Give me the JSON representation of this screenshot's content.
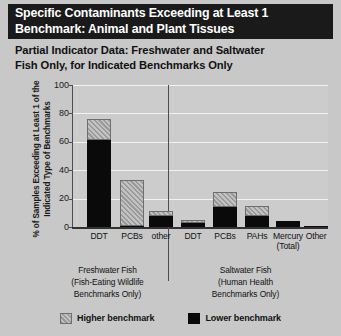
{
  "header": {
    "title_line1": "Specific Contaminants Exceeding at Least 1",
    "title_line2": "Benchmark: Animal and Plant Tissues",
    "subtitle_line1": "Partial Indicator Data: Freshwater and Saltwater",
    "subtitle_line2": "Fish Only, for Indicated Benchmarks Only"
  },
  "groups": {
    "freshwater": {
      "line1": "Freshwater Fish",
      "line2": "(Fish-Eating Wildlife",
      "line3": "Benchmarks Only)"
    },
    "saltwater": {
      "line1": "Saltwater Fish",
      "line2": "(Human Health",
      "line3": "Benchmarks Only)"
    }
  },
  "legend": {
    "higher_label": "Higher benchmark",
    "lower_label": "Lower benchmark",
    "higher_color": "#9a9a9a",
    "lower_color": "#0a0a0a"
  },
  "colors": {
    "page_background": "#c8c8c8",
    "header_background": "#1a1a1a",
    "header_text": "#ffffff",
    "plot_background": "#cccccc",
    "gridline": "#f2f2f2",
    "axis": "#4d4d4d",
    "text": "#111111"
  },
  "chart_data": {
    "type": "bar",
    "title": "Specific Contaminants Exceeding at Least 1 Benchmark: Animal and Plant Tissues",
    "subtitle": "Partial Indicator Data: Freshwater and Saltwater Fish Only, for Indicated Benchmarks Only",
    "xlabel": "",
    "ylabel": "% of Samples Exceeding at Least 1 of the Indicated Type of Benchmarks",
    "ylim": [
      0,
      100
    ],
    "yticks": [
      0,
      20,
      40,
      60,
      80,
      100
    ],
    "grid": true,
    "legend_position": "bottom",
    "stacked": true,
    "categories": [
      "DDT",
      "PCBs",
      "other",
      "DDT",
      "PCBs",
      "PAHs",
      "Mercury (Total)",
      "Other"
    ],
    "category_labels": [
      {
        "line1": "DDT",
        "line2": ""
      },
      {
        "line1": "PCBs",
        "line2": ""
      },
      {
        "line1": "other",
        "line2": ""
      },
      {
        "line1": "DDT",
        "line2": ""
      },
      {
        "line1": "PCBs",
        "line2": ""
      },
      {
        "line1": "PAHs",
        "line2": ""
      },
      {
        "line1": "Mercury",
        "line2": "(Total)"
      },
      {
        "line1": "Other",
        "line2": ""
      }
    ],
    "group_of_category": [
      "Freshwater Fish",
      "Freshwater Fish",
      "Freshwater Fish",
      "Saltwater Fish",
      "Saltwater Fish",
      "Saltwater Fish",
      "Saltwater Fish",
      "Saltwater Fish"
    ],
    "series": [
      {
        "name": "Lower benchmark",
        "color": "#0a0a0a",
        "values": [
          61,
          1,
          8,
          3,
          14,
          8,
          4,
          1
        ]
      },
      {
        "name": "Higher benchmark",
        "color": "#9a9a9a",
        "values": [
          15,
          32,
          3,
          2,
          11,
          7,
          0,
          0
        ]
      }
    ],
    "totals": [
      76,
      33,
      11,
      5,
      25,
      15,
      4,
      1
    ]
  }
}
